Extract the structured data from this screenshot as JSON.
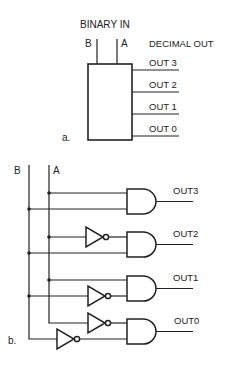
{
  "part_a": {
    "label": "a.",
    "input_title": "BINARY IN",
    "inputs": [
      "B",
      "A"
    ],
    "output_title": "DECIMAL OUT",
    "outputs": [
      "OUT 3",
      "OUT 2",
      "OUT 1",
      "OUT 0"
    ]
  },
  "part_b": {
    "label": "b.",
    "inputs": [
      "B",
      "A"
    ],
    "outputs": [
      "OUT3",
      "OUT2",
      "OUT1",
      "OUT0"
    ],
    "gates": [
      {
        "output": "OUT3",
        "type": "AND",
        "inputs": [
          "A",
          "B"
        ]
      },
      {
        "output": "OUT2",
        "type": "AND",
        "inputs": [
          "NOT A",
          "B"
        ]
      },
      {
        "output": "OUT1",
        "type": "AND",
        "inputs": [
          "A",
          "NOT B"
        ]
      },
      {
        "output": "OUT0",
        "type": "AND",
        "inputs": [
          "NOT A",
          "NOT B"
        ]
      }
    ]
  },
  "colors": {
    "ink": "#222222",
    "background": "#ffffff"
  }
}
